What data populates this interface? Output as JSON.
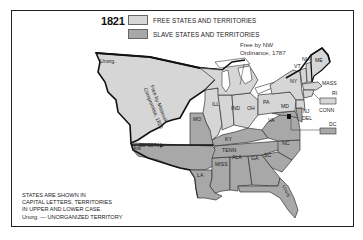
{
  "map": {
    "year": "1821",
    "colors": {
      "free": "#d6d6d6",
      "slave": "#a8a8a8",
      "border": "#111111",
      "frame": "#222222"
    },
    "legend": [
      {
        "label": "FREE STATES AND TERRITORIES",
        "type": "free"
      },
      {
        "label": "SLAVE STATES AND TERRITORIES",
        "type": "slave"
      }
    ],
    "annotations": {
      "nw_ordinance_line1": "Free by NW",
      "nw_ordinance_line2": "Ordinance, 1787",
      "missouri_line1": "Free by Missouri",
      "missouri_line2": "Compromise, 1820",
      "latitude": "36°30'N ▶"
    },
    "regions": {
      "unorg_west": "Unorg.",
      "ill": "ILL",
      "ind": "IND",
      "oh": "OH",
      "mo": "MO",
      "ky": "KY",
      "tenn": "TENN",
      "ark": "Ark",
      "la": "LA",
      "miss": "MISS",
      "ala": "ALA",
      "ga": "GA",
      "sc": "SC",
      "nc": "NC",
      "va": "VA",
      "md": "MD",
      "pa": "PA",
      "ny": "NY",
      "vt": "VT",
      "nh": "NH",
      "me": "ME",
      "mass": "MASS",
      "ri": "RI",
      "conn": "CONN",
      "nj": "NJ",
      "del": "DEL",
      "dc": "DC",
      "unorg_fl": "Unorg."
    },
    "footnote": [
      "STATES ARE SHOWN IN",
      "CAPITAL LETTERS, TERRITORIES",
      "IN UPPER AND LOWER CASE.",
      "Unorg. — UNORGANIZED TERRITORY"
    ]
  }
}
